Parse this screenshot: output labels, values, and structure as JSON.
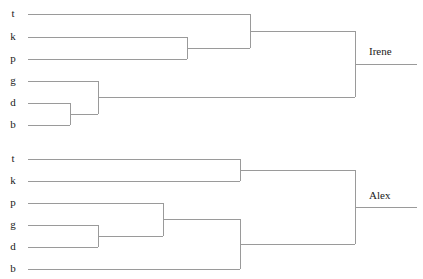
{
  "figure": {
    "type": "dendrogram-pair",
    "width": 423,
    "height": 279,
    "background_color": "#ffffff",
    "line_color": "#9a9a9a",
    "text_color": "#1a1a1a"
  },
  "chart_data": {
    "type": "tree",
    "title": "",
    "subtitle": "",
    "xlabel": "",
    "ylabel": "",
    "grid": false,
    "legend": "none",
    "orientation": "horizontal-left-to-right",
    "leaf_labels": [
      "t",
      "k",
      "p",
      "g",
      "d",
      "b"
    ],
    "trees": [
      {
        "name": "Irene",
        "root_label": "Irene",
        "leaf_order": [
          "t",
          "k",
          "p",
          "g",
          "d",
          "b"
        ],
        "leaves": [
          {
            "label": "t",
            "x_start": 28,
            "y": 14
          },
          {
            "label": "k",
            "x_start": 28,
            "y": 37
          },
          {
            "label": "p",
            "x_start": 28,
            "y": 59
          },
          {
            "label": "g",
            "x_start": 28,
            "y": 81
          },
          {
            "label": "d",
            "x_start": 28,
            "y": 103
          },
          {
            "label": "b",
            "x_start": 28,
            "y": 125
          }
        ],
        "label_x": 13,
        "merges": [
          {
            "id": "m1",
            "children": [
              "k",
              "p"
            ],
            "x": 187,
            "y_top": 37,
            "y_bot": 59,
            "y_mid": 48
          },
          {
            "id": "m2",
            "children": [
              "t",
              "m1"
            ],
            "x": 250,
            "y_top": 14,
            "y_bot": 48,
            "y_mid": 31
          },
          {
            "id": "m3",
            "children": [
              "d",
              "b"
            ],
            "x": 70,
            "y_top": 103,
            "y_bot": 125,
            "y_mid": 114
          },
          {
            "id": "m4",
            "children": [
              "g",
              "m3"
            ],
            "x": 98,
            "y_top": 81,
            "y_bot": 114,
            "y_mid": 97
          },
          {
            "id": "root",
            "children": [
              "m2",
              "m4"
            ],
            "x": 355,
            "y_top": 31,
            "y_bot": 97,
            "y_mid": 64
          }
        ],
        "root_stem": {
          "x_start": 355,
          "x_end": 417,
          "y": 64
        },
        "root_label_pos": {
          "x": 369,
          "y": 52
        }
      },
      {
        "name": "Alex",
        "root_label": "Alex",
        "leaf_order": [
          "t",
          "k",
          "p",
          "g",
          "d",
          "b"
        ],
        "leaves": [
          {
            "label": "t",
            "x_start": 28,
            "y": 159
          },
          {
            "label": "k",
            "x_start": 28,
            "y": 181
          },
          {
            "label": "p",
            "x_start": 28,
            "y": 203
          },
          {
            "label": "g",
            "x_start": 28,
            "y": 225
          },
          {
            "label": "d",
            "x_start": 28,
            "y": 247
          },
          {
            "label": "b",
            "x_start": 28,
            "y": 269
          }
        ],
        "label_x": 13,
        "merges": [
          {
            "id": "n1",
            "children": [
              "t",
              "k"
            ],
            "x": 240,
            "y_top": 159,
            "y_bot": 181,
            "y_mid": 170
          },
          {
            "id": "n2",
            "children": [
              "g",
              "d"
            ],
            "x": 98,
            "y_top": 225,
            "y_bot": 247,
            "y_mid": 236
          },
          {
            "id": "n3",
            "children": [
              "p",
              "n2"
            ],
            "x": 163,
            "y_top": 203,
            "y_bot": 236,
            "y_mid": 219
          },
          {
            "id": "n4",
            "children": [
              "n3",
              "b"
            ],
            "x": 240,
            "y_top": 219,
            "y_bot": 269,
            "y_mid": 244
          },
          {
            "id": "root",
            "children": [
              "n1",
              "n4"
            ],
            "x": 355,
            "y_top": 170,
            "y_bot": 244,
            "y_mid": 207
          }
        ],
        "root_stem": {
          "x_start": 355,
          "x_end": 417,
          "y": 207
        },
        "root_label_pos": {
          "x": 369,
          "y": 196
        }
      }
    ]
  }
}
